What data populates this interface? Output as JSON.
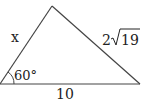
{
  "diagram": {
    "type": "triangle",
    "vertices": {
      "bottom_left": [
        0,
        84
      ],
      "apex": [
        52,
        6
      ],
      "bottom_right": [
        140,
        84
      ]
    },
    "labels": {
      "left_side": "x",
      "right_side_coef": "2",
      "right_side_radicand": "19",
      "base": "10",
      "angle": "60°"
    },
    "colors": {
      "stroke": "#333333",
      "text": "#222222"
    }
  }
}
